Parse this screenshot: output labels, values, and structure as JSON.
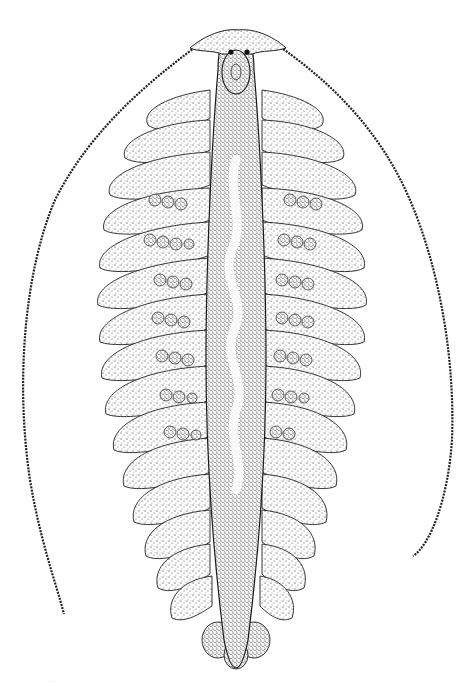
{
  "figure": {
    "background_color": "#ffffff",
    "ink_color": "#1a1a1a",
    "parts": [
      "head-with-two-eyespots",
      "two-long-segmented-antennae",
      "central-elongated-stippled-body",
      "wavy-pale-median-gut-band",
      "paired-lateral-lobed-appendages",
      "rows-of-round-egg-like-granules",
      "clustered-posterior-lobes"
    ]
  },
  "caption": {
    "faint_mark": "..."
  }
}
